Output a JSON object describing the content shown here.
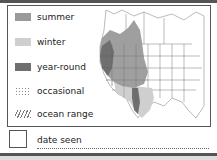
{
  "legend": {
    "items": [
      {
        "label": "summer",
        "color": "#9a9a9a",
        "pattern": "solid"
      },
      {
        "label": "winter",
        "color": "#cfcfcf",
        "pattern": "solid"
      },
      {
        "label": "year-round",
        "color": "#6f6f6f",
        "pattern": "solid"
      },
      {
        "label": "occasional",
        "color": "#8a8a8a",
        "pattern": "dots"
      },
      {
        "label": "ocean range",
        "color": "#777777",
        "pattern": "hatch"
      }
    ]
  },
  "footer": {
    "date_label": "date seen"
  }
}
